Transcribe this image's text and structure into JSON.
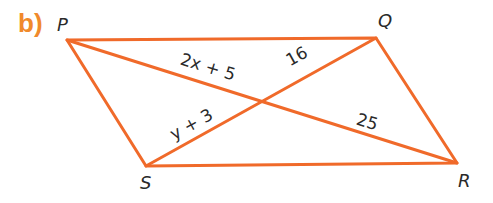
{
  "part_label": "b)",
  "colors": {
    "line": "#f06a2a",
    "part_label": "#f08a2c",
    "text": "#2a2a2a"
  },
  "vertices": {
    "P": "P",
    "Q": "Q",
    "R": "R",
    "S": "S"
  },
  "segments": {
    "PT": "2x + 5",
    "QT": "16",
    "ST": "y + 3",
    "RT": "25"
  }
}
